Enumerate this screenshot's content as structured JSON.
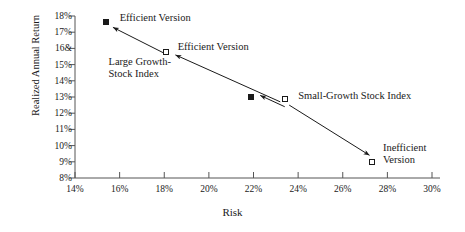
{
  "chart_data": {
    "type": "scatter",
    "title": "",
    "xlabel": "Risk",
    "ylabel": "Realized Annual Return",
    "xlim": [
      14,
      30
    ],
    "ylim": [
      8,
      18
    ],
    "grid": false,
    "legend": "none",
    "xticks": [
      "14%",
      "16%",
      "18%",
      "20%",
      "22%",
      "24%",
      "26%",
      "28%",
      "30%"
    ],
    "xtick_values": [
      14,
      16,
      18,
      20,
      22,
      24,
      26,
      28,
      30
    ],
    "yticks": [
      "18%",
      "17%",
      "16&",
      "15%",
      "14%",
      "13%",
      "12%",
      "11%",
      "10%",
      "9%",
      "8%"
    ],
    "ytick_values": [
      18,
      17,
      16,
      15,
      14,
      13,
      12,
      11,
      10,
      9,
      8
    ],
    "points": [
      {
        "name": "efficient-version-large-growth",
        "x": 15.4,
        "y": 17.6,
        "marker": "filled-square",
        "label": "Efficient Version"
      },
      {
        "name": "large-growth-stock-index",
        "x": 18.1,
        "y": 15.8,
        "marker": "hollow-square",
        "label": "Efficient Version"
      },
      {
        "name": "efficient-version-small-growth",
        "x": 21.9,
        "y": 13.0,
        "marker": "filled-square",
        "label": ""
      },
      {
        "name": "small-growth-stock-index",
        "x": 23.4,
        "y": 12.9,
        "marker": "hollow-square",
        "label": "Small-Growth Stock Index"
      },
      {
        "name": "inefficient-version",
        "x": 27.3,
        "y": 9.0,
        "marker": "hollow-square",
        "label": "Inefficient Version"
      }
    ],
    "annotations": [
      {
        "name": "efficient-version-top",
        "text": "Efficient Version",
        "x": 16.0,
        "y": 17.8
      },
      {
        "name": "efficient-version-middle",
        "text": "Efficient Version",
        "x": 18.6,
        "y": 16.0
      },
      {
        "name": "large-growth-stock-index",
        "text": "Large Growth-\nStock Index",
        "x": 15.5,
        "y": 15.1
      },
      {
        "name": "small-growth-stock-index",
        "text": "Small-Growth Stock Index",
        "x": 24.0,
        "y": 13.0
      },
      {
        "name": "inefficient-version",
        "text": "Inefficient\nVersion",
        "x": 27.8,
        "y": 9.8
      }
    ],
    "arrows": [
      {
        "name": "arrow-to-efficient-top",
        "from": [
          18.0,
          15.7
        ],
        "to": [
          15.7,
          17.3
        ]
      },
      {
        "name": "arrow-to-efficient-middle-upper",
        "from": [
          23.2,
          12.7
        ],
        "to": [
          18.5,
          15.6
        ]
      },
      {
        "name": "arrow-to-efficient-middle-lower",
        "from": [
          23.4,
          12.4
        ],
        "to": [
          22.3,
          13.1
        ]
      },
      {
        "name": "arrow-to-inefficient",
        "from": [
          23.6,
          12.5
        ],
        "to": [
          27.2,
          9.4
        ]
      }
    ],
    "colors": {
      "axis": "#555555",
      "marker": "#1a1a1a",
      "text": "#1a1a1a",
      "background": "#ffffff"
    }
  }
}
